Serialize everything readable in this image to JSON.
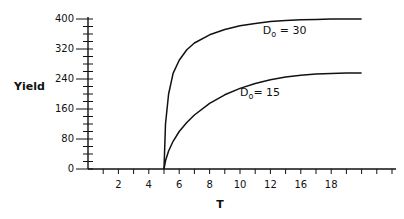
{
  "chart_data": {
    "type": "line",
    "title": "",
    "xlabel": "T",
    "ylabel": "Yield",
    "xlim": [
      0,
      20
    ],
    "ylim": [
      0,
      400
    ],
    "x_tick_labels": [
      {
        "pos": 2,
        "label": "2"
      },
      {
        "pos": 4,
        "label": "4"
      },
      {
        "pos": 6,
        "label": "6"
      },
      {
        "pos": 8,
        "label": "8"
      },
      {
        "pos": 10,
        "label": "10"
      },
      {
        "pos": 12,
        "label": "12"
      },
      {
        "pos": 14,
        "label": "16"
      },
      {
        "pos": 16,
        "label": "18"
      }
    ],
    "x_minor_ticks": 20,
    "y_tick_labels": [
      0,
      80,
      160,
      240,
      320,
      400
    ],
    "y_minor_step": 20,
    "grid": false,
    "legend": "none (inline annotations)",
    "series": [
      {
        "name": "D0 = 30",
        "x": [
          5,
          5.1,
          5.3,
          5.6,
          6,
          6.5,
          7,
          8,
          9,
          10,
          11,
          12,
          13,
          14,
          15,
          16,
          17,
          18
        ],
        "y": [
          0,
          120,
          200,
          255,
          290,
          318,
          336,
          358,
          372,
          382,
          388,
          393,
          396,
          398,
          399,
          400,
          400,
          400
        ]
      },
      {
        "name": "D0 = 15",
        "x": [
          5,
          5.1,
          5.3,
          5.6,
          6,
          6.5,
          7,
          8,
          9,
          10,
          11,
          12,
          13,
          14,
          15,
          16,
          17,
          18
        ],
        "y": [
          0,
          22,
          48,
          74,
          100,
          124,
          144,
          175,
          198,
          215,
          228,
          238,
          245,
          250,
          253,
          255,
          256,
          256
        ]
      }
    ],
    "annotations": [
      {
        "text_main": "D",
        "text_sub": "o",
        "text_rest": " = 30",
        "x": 11.5,
        "y": 360
      },
      {
        "text_main": "D",
        "text_sub": "o",
        "text_rest": "= 15",
        "x": 10,
        "y": 195
      }
    ]
  }
}
